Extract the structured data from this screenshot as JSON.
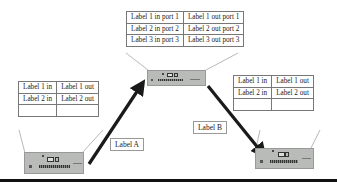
{
  "diagram": {
    "type": "network-forwarding",
    "center_table": {
      "rows": [
        [
          "Label 1 in port 1",
          "Label 1 out port 1"
        ],
        [
          "Label 2 in port 2",
          "Label 2 out port 2"
        ],
        [
          "Label 3 in port 3",
          "Label 3 out port 3"
        ]
      ]
    },
    "left_table": {
      "rows": [
        [
          "Label 1 in",
          "Label 1 out"
        ],
        [
          "Label 2 in",
          "Label 2 out"
        ],
        [
          "",
          ""
        ]
      ]
    },
    "right_table": {
      "rows": [
        [
          "Label 1 in",
          "Label 1 out"
        ],
        [
          "Label 2 in",
          "Label 2 out"
        ],
        [
          "",
          ""
        ]
      ]
    },
    "arrows": {
      "a": {
        "label": "Label A",
        "from": "left-device",
        "to": "center-device"
      },
      "b": {
        "label": "Label B",
        "from": "center-device",
        "to": "right-device"
      }
    },
    "colors": {
      "device": "#b9bbb9",
      "arrow": "#1a1a1a",
      "table_border": "#333333"
    }
  }
}
